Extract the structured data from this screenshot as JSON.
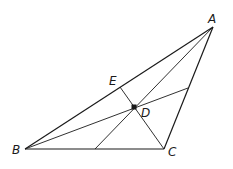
{
  "diagram": {
    "type": "triangle-with-cevians",
    "stroke_color": "#1a1a1a",
    "background": "#ffffff",
    "points": {
      "A": {
        "label": "A",
        "x": 213,
        "y": 27
      },
      "B": {
        "label": "B",
        "x": 25,
        "y": 149
      },
      "C": {
        "label": "C",
        "x": 164,
        "y": 149
      },
      "D": {
        "label": "D",
        "x": 134,
        "y": 107
      },
      "E": {
        "label": "E",
        "x": 120,
        "y": 87
      }
    },
    "labels": {
      "A": "A",
      "B": "B",
      "C": "C",
      "D": "D",
      "E": "E"
    },
    "segments": [
      {
        "name": "side-AB",
        "from": [
          213,
          27
        ],
        "to": [
          25,
          149
        ]
      },
      {
        "name": "side-BC",
        "from": [
          25,
          149
        ],
        "to": [
          164,
          149
        ]
      },
      {
        "name": "side-CA",
        "from": [
          164,
          149
        ],
        "to": [
          213,
          27
        ]
      },
      {
        "name": "cevian-CE",
        "from": [
          164,
          149
        ],
        "to": [
          120,
          87
        ]
      },
      {
        "name": "cevian-from-B-to-AC",
        "from": [
          25,
          149
        ],
        "to": [
          188,
          88
        ]
      },
      {
        "name": "cevian-from-A-to-BC",
        "from": [
          213,
          27
        ],
        "to": [
          95,
          149
        ]
      }
    ]
  }
}
